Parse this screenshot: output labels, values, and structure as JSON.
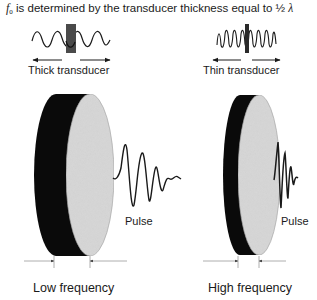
{
  "title": {
    "symbol": "f",
    "subscript": "0",
    "text": " is determined by the transducer thickness equal to ½ ",
    "lambda": "λ"
  },
  "top_panels": [
    {
      "label": "Thick transducer",
      "wave": "long-wavelength-sine",
      "element": "thick-bar"
    },
    {
      "label": "Thin transducer",
      "wave": "short-wavelength-sine",
      "element": "thin-bar"
    }
  ],
  "discs": [
    {
      "pulse_label": "Pulse",
      "caption": "Low frequency",
      "thickness": "thick"
    },
    {
      "pulse_label": "Pulse",
      "caption": "High frequency",
      "thickness": "thin"
    }
  ],
  "colors": {
    "ink": "#1a1a1a",
    "bar": "#4a4a4a",
    "disc_face": "#d8d8d8",
    "disc_back": "#0a0a0a",
    "dim_line": "#9a9a9a"
  }
}
